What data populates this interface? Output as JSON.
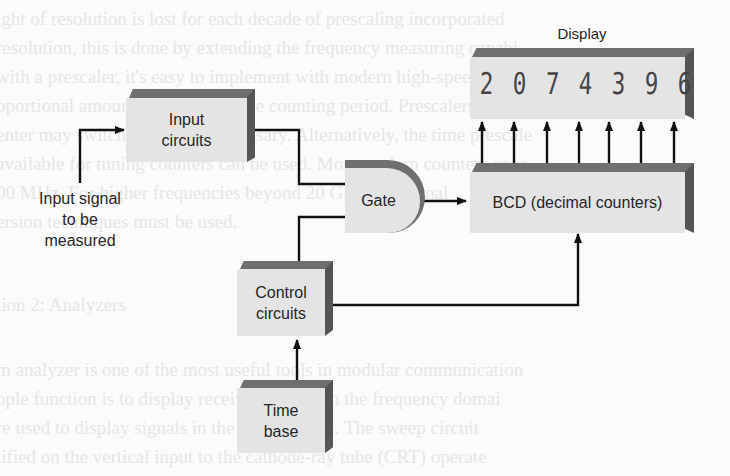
{
  "diagram": {
    "blocks": {
      "input_circuits": "Input\ncircuits",
      "gate": "Gate",
      "display": "Display",
      "bcd": "BCD (decimal counters)",
      "control": "Control\ncircuits",
      "time_base": "Time\nbase"
    },
    "input_label": "Input signal\nto be\nmeasured",
    "display_digits": [
      "2",
      "0",
      "7",
      "4",
      "3",
      "9",
      "6"
    ],
    "colors": {
      "block_face": "#e4e4e4",
      "bevel": "#6f6f6f",
      "line": "#111111"
    },
    "edges": [
      {
        "from": "input_signal",
        "to": "input_circuits"
      },
      {
        "from": "input_circuits",
        "to": "gate"
      },
      {
        "from": "control_circuits",
        "to": "gate"
      },
      {
        "from": "gate",
        "to": "bcd"
      },
      {
        "from": "bcd",
        "to": "display",
        "count": 7
      },
      {
        "from": "control_circuits",
        "to": "bcd"
      },
      {
        "from": "time_base",
        "to": "control_circuits"
      }
    ]
  },
  "background_text": [
    "ight of resolution is lost for each decade of prescaling incorporated",
    "resolution, this is done by extending the frequency measuring capabi",
    "with a prescaler, it's easy to implement with modern high-speed IC's",
    "oportional amount of extending the counting period. Prescalers can",
    "enter may switched in when necessary. Alternatively, the time prescale",
    "available for tuning counters can be used. Most modern counters oper",
    "00 MHz. For higher frequencies beyond 20 GHz, the signal",
    "ersion techniques must be used.",
    "",
    "tion 2: Analyzers",
    "",
    "m analyzer is one of the most useful tools in modular communication",
    "ople function is to display received signals in the frequency domai",
    "re used to display signals in the time domain. The sweep circuit",
    "lified on the vertical input to the cathode-ray tube (CRT) operate"
  ]
}
